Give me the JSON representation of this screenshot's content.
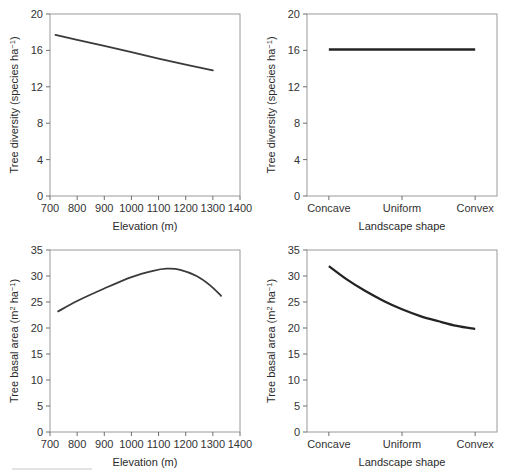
{
  "figure": {
    "panel_count": 4,
    "line_color": "#3a3a3a",
    "frame_color": "#9a9a9a",
    "background": "#ffffff"
  },
  "axis_titles": {
    "elevation": "Elevation (m)",
    "landscape": "Landscape shape",
    "diversity_main": "Tree diversity (species ha",
    "diversity_sup": "−1",
    "diversity_tail": ")",
    "basal_main": "Tree basal area (m",
    "basal_sup1": "2",
    "basal_mid": " ha",
    "basal_sup2": "−1",
    "basal_tail": ")"
  },
  "chart_data": [
    {
      "id": "panel-a",
      "type": "line",
      "title": "",
      "xlabel": "Elevation (m)",
      "ylabel": "Tree diversity (species ha⁻¹)",
      "xlim": [
        700,
        1400
      ],
      "ylim": [
        0,
        20
      ],
      "xticks": [
        700,
        800,
        900,
        1000,
        1100,
        1200,
        1300,
        1400
      ],
      "xticklabels": [
        "700",
        "800",
        "900",
        "1000",
        "1100",
        "1200",
        "1300",
        "1400"
      ],
      "yticks": [
        0,
        4,
        8,
        12,
        16,
        20
      ],
      "yticklabels": [
        "0",
        "4",
        "8",
        "12",
        "16",
        "20"
      ],
      "grid": false,
      "legend": "none",
      "x": [
        720,
        800,
        900,
        1000,
        1100,
        1200,
        1300
      ],
      "y": [
        17.7,
        17.15,
        16.5,
        15.8,
        15.1,
        14.45,
        13.8
      ]
    },
    {
      "id": "panel-b",
      "type": "line",
      "title": "",
      "xlabel": "Landscape shape",
      "ylabel": "Tree diversity (species ha⁻¹)",
      "categories": [
        "Concave",
        "Uniform",
        "Convex"
      ],
      "ylim": [
        0,
        20
      ],
      "yticks": [
        0,
        4,
        8,
        12,
        16,
        20
      ],
      "yticklabels": [
        "0",
        "4",
        "8",
        "12",
        "16",
        "20"
      ],
      "grid": false,
      "legend": "none",
      "x": [
        0,
        1,
        2
      ],
      "y": [
        16.1,
        16.1,
        16.1
      ]
    },
    {
      "id": "panel-c",
      "type": "line",
      "title": "",
      "xlabel": "Elevation (m)",
      "ylabel": "Tree basal area (m² ha⁻¹)",
      "xlim": [
        700,
        1400
      ],
      "ylim": [
        0,
        35
      ],
      "xticks": [
        700,
        800,
        900,
        1000,
        1100,
        1200,
        1300,
        1400
      ],
      "xticklabels": [
        "700",
        "800",
        "900",
        "1000",
        "1100",
        "1200",
        "1300",
        "1400"
      ],
      "yticks": [
        0,
        5,
        10,
        15,
        20,
        25,
        30,
        35
      ],
      "yticklabels": [
        "0",
        "5",
        "10",
        "15",
        "20",
        "25",
        "30",
        "35"
      ],
      "grid": false,
      "legend": "none",
      "x": [
        730,
        800,
        900,
        1000,
        1080,
        1130,
        1180,
        1240,
        1290,
        1330
      ],
      "y": [
        23.2,
        25.2,
        27.6,
        29.8,
        31.0,
        31.4,
        31.2,
        30.0,
        28.2,
        26.2
      ]
    },
    {
      "id": "panel-d",
      "type": "line",
      "title": "",
      "xlabel": "Landscape shape",
      "ylabel": "Tree basal area (m² ha⁻¹)",
      "categories": [
        "Concave",
        "Uniform",
        "Convex"
      ],
      "ylim": [
        0,
        35
      ],
      "yticks": [
        0,
        5,
        10,
        15,
        20,
        25,
        30,
        35
      ],
      "yticklabels": [
        "0",
        "5",
        "10",
        "15",
        "20",
        "25",
        "30",
        "35"
      ],
      "grid": false,
      "legend": "none",
      "x": [
        0,
        0.25,
        0.5,
        0.75,
        1.0,
        1.25,
        1.5,
        1.75,
        2.0
      ],
      "y": [
        31.9,
        29.3,
        27.1,
        25.2,
        23.6,
        22.3,
        21.3,
        20.4,
        19.8
      ]
    }
  ]
}
